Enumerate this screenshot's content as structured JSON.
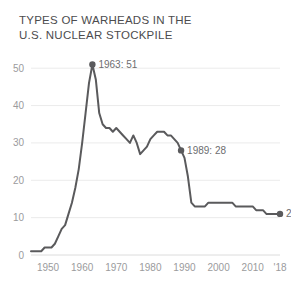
{
  "title": {
    "line1": "TYPES OF WARHEADS IN THE",
    "line2": "U.S. NUCLEAR STOCKPILE"
  },
  "colors": {
    "line": "#5a5a5c",
    "grid": "#ebebeb",
    "axis_text": "#9b9b9d",
    "annotation_text": "#6d6d6f",
    "title_text": "#4c4c4e",
    "background": "#ffffff"
  },
  "chart_data": {
    "type": "line",
    "title": "TYPES OF WARHEADS IN THE U.S. NUCLEAR STOCKPILE",
    "xlabel": "",
    "ylabel": "",
    "xlim": [
      1945,
      2018
    ],
    "ylim": [
      0,
      53
    ],
    "grid": true,
    "legend": "none",
    "yticks": [
      0,
      10,
      20,
      30,
      40,
      50
    ],
    "ytick_labels": [
      "0",
      "10",
      "20",
      "30",
      "40",
      "50"
    ],
    "xticks": [
      1950,
      1960,
      1970,
      1980,
      1990,
      2000,
      2010,
      2018
    ],
    "xtick_labels": [
      "1950",
      "1960",
      "1970",
      "1980",
      "1990",
      "2000",
      "2010",
      "'18"
    ],
    "series": [
      {
        "name": "Types of warheads",
        "x": [
          1945,
          1946,
          1947,
          1948,
          1949,
          1950,
          1951,
          1952,
          1953,
          1954,
          1955,
          1956,
          1957,
          1958,
          1959,
          1960,
          1961,
          1962,
          1963,
          1964,
          1965,
          1966,
          1967,
          1968,
          1969,
          1970,
          1971,
          1972,
          1973,
          1974,
          1975,
          1976,
          1977,
          1978,
          1979,
          1980,
          1981,
          1982,
          1983,
          1984,
          1985,
          1986,
          1987,
          1988,
          1989,
          1990,
          1991,
          1992,
          1993,
          1994,
          1995,
          1996,
          1997,
          1998,
          1999,
          2000,
          2001,
          2002,
          2003,
          2004,
          2005,
          2006,
          2007,
          2008,
          2009,
          2010,
          2011,
          2012,
          2013,
          2014,
          2015,
          2016,
          2017,
          2018
        ],
        "values": [
          1,
          1,
          1,
          1,
          2,
          2,
          2,
          3,
          5,
          7,
          8,
          11,
          14,
          18,
          23,
          30,
          38,
          46,
          51,
          47,
          38,
          35,
          34,
          34,
          33,
          34,
          33,
          32,
          31,
          30,
          32,
          30,
          27,
          28,
          29,
          31,
          32,
          33,
          33,
          33,
          32,
          32,
          31,
          30,
          28,
          26,
          21,
          14,
          13,
          13,
          13,
          13,
          14,
          14,
          14,
          14,
          14,
          14,
          14,
          14,
          13,
          13,
          13,
          13,
          13,
          13,
          12,
          12,
          12,
          11,
          11,
          11,
          11,
          11
        ]
      }
    ],
    "annotations": [
      {
        "label": "1963: 51",
        "x": 1963,
        "y": 51,
        "marker": true
      },
      {
        "label": "1989: 28",
        "x": 1989,
        "y": 28,
        "marker": true
      },
      {
        "label": "2018: 11",
        "x": 2018,
        "y": 11,
        "marker": true
      }
    ]
  }
}
